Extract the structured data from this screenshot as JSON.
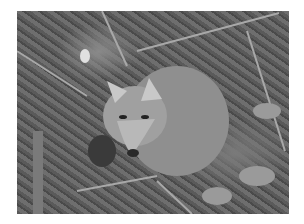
{
  "image": {
    "subject": "gray fox",
    "description": "Grayscale photograph of a gray fox crouching in forest leaf litter among twigs and dry leaves",
    "colors": {
      "background": "#ffffff",
      "fur_light": "#b8b8b8",
      "fur_mid": "#9a9a9a",
      "ground_dark": "#4a4a4a",
      "ground_mid": "#6e6e6e"
    }
  }
}
